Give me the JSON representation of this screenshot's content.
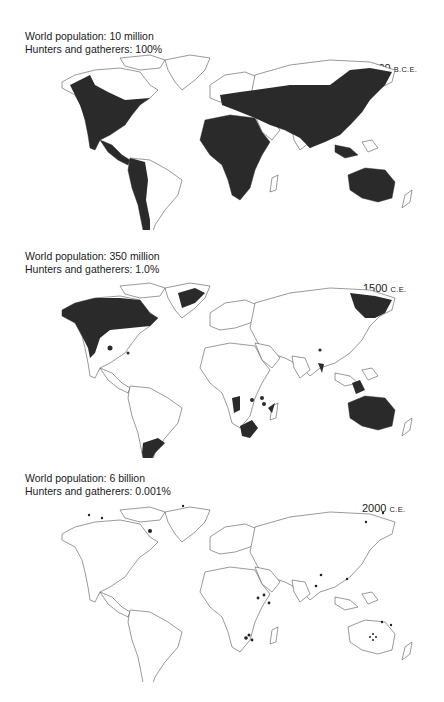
{
  "panels": [
    {
      "population_label": "World population: 10 million",
      "hunters_label": "Hunters and gatherers: 100%",
      "era_number": "10,000",
      "era_suffix": "B.C.E.",
      "coverage": "nearly all habitable land"
    },
    {
      "population_label": "World population: 350 million",
      "hunters_label": "Hunters and gatherers: 1.0%",
      "era_number": "1500",
      "era_suffix": "C.E.",
      "coverage": "northern North America, southern South America, southern/central Africa pockets, Australia, NE Siberia, Borneo, Greenland coast"
    },
    {
      "population_label": "World population: 6 billion",
      "hunters_label": "Hunters and gatherers: 0.001%",
      "era_number": "2000",
      "era_suffix": "C.E.",
      "coverage": "scattered small dots"
    }
  ],
  "colors": {
    "hunter_gatherer_fill": "#2a2a2a",
    "land_outline": "#555555",
    "background": "#ffffff"
  }
}
